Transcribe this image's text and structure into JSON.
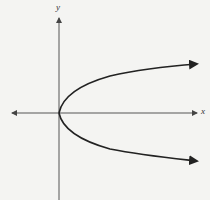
{
  "diagram": {
    "type": "graph",
    "axes": {
      "x_label": "x",
      "y_label": "y"
    },
    "curve": {
      "equation": "x = y^2",
      "vertex": [
        0,
        0
      ],
      "opens": "right",
      "branches_arrowed": true
    },
    "colors": {
      "background": "#f4f4f2",
      "axis": "#555555",
      "curve": "#222222"
    }
  }
}
